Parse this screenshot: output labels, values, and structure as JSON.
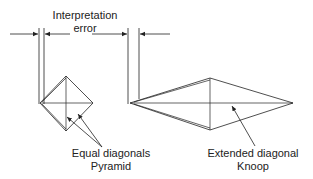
{
  "diagram": {
    "title_label": {
      "line1": "Interpretation",
      "line2": "error"
    },
    "pyramid_label": {
      "line1": "Equal diagonals",
      "line2": "Pyramid"
    },
    "knoop_label": {
      "line1": "Extended diagonal",
      "line2": "Knoop"
    },
    "colors": {
      "stroke": "#222222",
      "background": "#ffffff"
    }
  }
}
